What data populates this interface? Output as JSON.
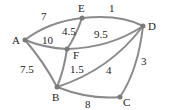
{
  "graph": {
    "nodes": {
      "A": "A",
      "B": "B",
      "C": "C",
      "D": "D",
      "E": "E",
      "F": "F"
    },
    "edges": {
      "AE": "7",
      "ED": "1",
      "AF": "10",
      "EF": "4.5",
      "FD": "9.5",
      "AB": "7.5",
      "FB": "1.5",
      "BD": "4",
      "DC": "3",
      "BC": "8"
    }
  },
  "colors": {
    "edge": "#8a8a8a",
    "node": "#7a7a7a",
    "text": "#222222"
  }
}
